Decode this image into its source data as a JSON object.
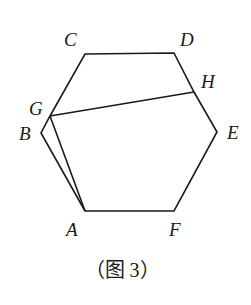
{
  "figure": {
    "caption": "（图 3）",
    "stroke_color": "#1a1a1a",
    "points": {
      "A": {
        "x": 85,
        "y": 211,
        "label": "A",
        "lx": 66,
        "ly": 236
      },
      "B": {
        "x": 41,
        "y": 133,
        "label": "B",
        "lx": 19,
        "ly": 140
      },
      "C": {
        "x": 85,
        "y": 54,
        "label": "C",
        "lx": 64,
        "ly": 46
      },
      "D": {
        "x": 174,
        "y": 53,
        "label": "D",
        "lx": 180,
        "ly": 46
      },
      "E": {
        "x": 217,
        "y": 132,
        "label": "E",
        "lx": 227,
        "ly": 139
      },
      "F": {
        "x": 174,
        "y": 211,
        "label": "F",
        "lx": 169,
        "ly": 236
      },
      "G": {
        "x": 50,
        "y": 116,
        "label": "G",
        "lx": 29,
        "ly": 115
      },
      "H": {
        "x": 194,
        "y": 92,
        "label": "H",
        "lx": 201,
        "ly": 88
      }
    },
    "segments": [
      [
        "A",
        "B"
      ],
      [
        "B",
        "G"
      ],
      [
        "G",
        "C"
      ],
      [
        "C",
        "D"
      ],
      [
        "D",
        "H"
      ],
      [
        "H",
        "E"
      ],
      [
        "E",
        "F"
      ],
      [
        "F",
        "A"
      ],
      [
        "G",
        "H"
      ],
      [
        "G",
        "A"
      ]
    ]
  }
}
